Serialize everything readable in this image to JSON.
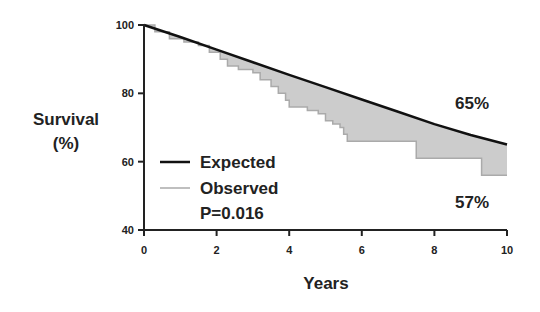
{
  "chart_data": {
    "type": "line",
    "title": "",
    "xlabel": "Years",
    "ylabel": "Survival (%)",
    "ylabel_lines": [
      "Survival",
      "(%)"
    ],
    "xlim": [
      0,
      10
    ],
    "ylim": [
      40,
      100
    ],
    "x_ticks": [
      0,
      2,
      4,
      6,
      8,
      10
    ],
    "y_ticks": [
      40,
      60,
      80,
      100
    ],
    "grid": false,
    "legend_position": "lower-left inside",
    "series": [
      {
        "name": "Expected",
        "style": "smooth",
        "color": "#111111",
        "x": [
          0,
          1,
          2,
          3,
          4,
          5,
          6,
          7,
          8,
          9,
          10
        ],
        "y": [
          100,
          96.5,
          92.8,
          89.1,
          85.4,
          81.8,
          78.2,
          74.6,
          71.0,
          67.8,
          65
        ]
      },
      {
        "name": "Observed",
        "style": "step",
        "color": "#aaaaaa",
        "x": [
          0,
          0.3,
          0.7,
          1.1,
          1.5,
          1.8,
          2.1,
          2.3,
          2.6,
          3.0,
          3.2,
          3.5,
          3.7,
          3.9,
          4.0,
          4.5,
          4.8,
          5.0,
          5.2,
          5.4,
          5.5,
          5.6,
          7.5,
          9.3,
          10
        ],
        "y": [
          100,
          98,
          96,
          95,
          94,
          92,
          90,
          88,
          87,
          86,
          84,
          82,
          80,
          78,
          76,
          75,
          74,
          72,
          71,
          70,
          68,
          66,
          61,
          56,
          56
        ]
      }
    ],
    "fill_between": {
      "series": [
        "Expected",
        "Observed"
      ],
      "color": "#cccccc"
    },
    "annotations": [
      {
        "text": "65%",
        "x": 8.9,
        "y": 70
      },
      {
        "text": "57%",
        "x": 8.9,
        "y": 54
      }
    ],
    "legend": {
      "entries": [
        "Expected",
        "Observed"
      ],
      "note": "P=0.016"
    }
  }
}
